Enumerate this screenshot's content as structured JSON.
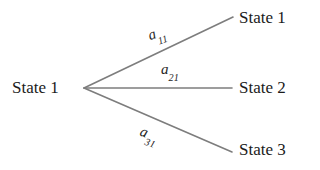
{
  "diagram": {
    "type": "state-transition-tree",
    "background_color": "#ffffff",
    "edge_color": "#7d7d7d",
    "text_color": "#1b1b1b",
    "source_node": {
      "label": "State 1"
    },
    "target_nodes": [
      {
        "label": "State 1"
      },
      {
        "label": "State 2"
      },
      {
        "label": "State 3"
      }
    ],
    "edges": [
      {
        "label_base": "a",
        "label_sub": "11",
        "from": "State 1",
        "to": "State 1",
        "x1": 84,
        "y1": 88,
        "x2": 233,
        "y2": 17
      },
      {
        "label_base": "a",
        "label_sub": "21",
        "from": "State 1",
        "to": "State 2",
        "x1": 84,
        "y1": 88,
        "x2": 232,
        "y2": 88
      },
      {
        "label_base": "a",
        "label_sub": "31",
        "from": "State 1",
        "to": "State 3",
        "x1": 84,
        "y1": 88,
        "x2": 232,
        "y2": 152
      }
    ]
  }
}
